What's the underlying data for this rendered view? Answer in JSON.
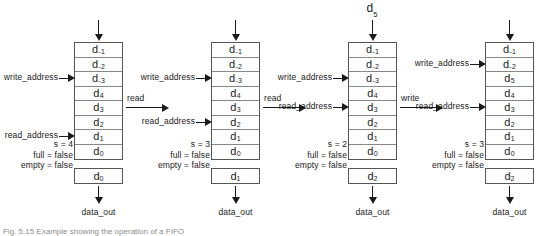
{
  "figure": {
    "caption": "Fig. 5.15  Example showing the operation of a FIFO"
  },
  "labels": {
    "write_address": "write_address",
    "read_address": "read_address",
    "data_out": "data_out",
    "full_prefix": "full = ",
    "empty_prefix": "empty = "
  },
  "transitions": [
    {
      "name": "read",
      "label": "read"
    },
    {
      "name": "read2",
      "label": "read"
    },
    {
      "name": "write",
      "label": "write"
    }
  ],
  "panels": [
    {
      "id": "panel-1",
      "input_label": "",
      "cells": [
        {
          "base": "d",
          "sub": "-1"
        },
        {
          "base": "d",
          "sub": "-2"
        },
        {
          "base": "d",
          "sub": "-3"
        },
        {
          "base": "d",
          "sub": "4"
        },
        {
          "base": "d",
          "sub": "3"
        },
        {
          "base": "d",
          "sub": "2"
        },
        {
          "base": "d",
          "sub": "1"
        },
        {
          "base": "d",
          "sub": "0"
        }
      ],
      "write_index": 2,
      "read_index": 6,
      "s_text": "s = 4",
      "full_text": "full = false",
      "empty_text": "empty = false",
      "out_cell": {
        "base": "d",
        "sub": "0"
      },
      "data_out": "data_out"
    },
    {
      "id": "panel-2",
      "input_label": "",
      "cells": [
        {
          "base": "d",
          "sub": "-1"
        },
        {
          "base": "d",
          "sub": "-2"
        },
        {
          "base": "d",
          "sub": "-3"
        },
        {
          "base": "d",
          "sub": "4"
        },
        {
          "base": "d",
          "sub": "3"
        },
        {
          "base": "d",
          "sub": "2"
        },
        {
          "base": "d",
          "sub": "1"
        },
        {
          "base": "d",
          "sub": "0"
        }
      ],
      "write_index": 2,
      "read_index": 5,
      "s_text": "s = 3",
      "full_text": "full = false",
      "empty_text": "empty = false",
      "out_cell": {
        "base": "d",
        "sub": "1"
      },
      "data_out": "data_out"
    },
    {
      "id": "panel-3",
      "input_label": "d",
      "input_sub": "5",
      "cells": [
        {
          "base": "d",
          "sub": "-1"
        },
        {
          "base": "d",
          "sub": "-2"
        },
        {
          "base": "d",
          "sub": "-3"
        },
        {
          "base": "d",
          "sub": "4"
        },
        {
          "base": "d",
          "sub": "3"
        },
        {
          "base": "d",
          "sub": "2"
        },
        {
          "base": "d",
          "sub": "1"
        },
        {
          "base": "d",
          "sub": "0"
        }
      ],
      "write_index": 2,
      "read_index": 4,
      "s_text": "s = 2",
      "full_text": "full = false",
      "empty_text": "empty = false",
      "out_cell": {
        "base": "d",
        "sub": "2"
      },
      "data_out": "data_out"
    },
    {
      "id": "panel-4",
      "input_label": "",
      "cells": [
        {
          "base": "d",
          "sub": "-1"
        },
        {
          "base": "d",
          "sub": "-2"
        },
        {
          "base": "d",
          "sub": "5"
        },
        {
          "base": "d",
          "sub": "4"
        },
        {
          "base": "d",
          "sub": "3"
        },
        {
          "base": "d",
          "sub": "2"
        },
        {
          "base": "d",
          "sub": "1"
        },
        {
          "base": "d",
          "sub": "0"
        }
      ],
      "write_index": 1,
      "read_index": 4,
      "s_text": "s = 3",
      "full_text": "full = false",
      "empty_text": "empty = false",
      "out_cell": {
        "base": "d",
        "sub": "2"
      },
      "data_out": "data_out"
    }
  ],
  "colors": {
    "ink": "#1a1a1a",
    "box_border": "#555555",
    "cell_border": "#888888",
    "background": "#ffffff"
  }
}
